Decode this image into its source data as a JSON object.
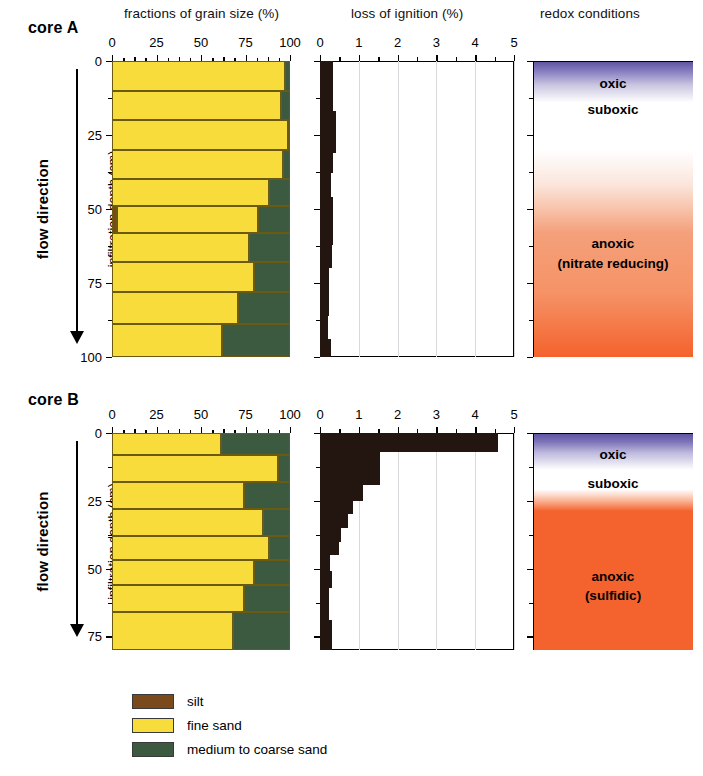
{
  "headers": {
    "grain_size": "fractions of grain size (%)",
    "loss_of_ignition": "loss of ignition (%)",
    "redox": "redox conditions"
  },
  "axis": {
    "y_label": "infiltration depth (cm)",
    "flow_direction": "flow direction",
    "grain_ticks": [
      "0",
      "25",
      "50",
      "75",
      "100"
    ],
    "loi_ticks": [
      "0",
      "1",
      "2",
      "3",
      "4",
      "5"
    ]
  },
  "legend": {
    "items": [
      {
        "label": "silt",
        "color": "#7a4a1c"
      },
      {
        "label": "fine sand",
        "color": "#f8dc3c"
      },
      {
        "label": "medium to coarse sand",
        "color": "#3b5a40"
      }
    ]
  },
  "colors": {
    "silt": "#7a4a1c",
    "fine_sand": "#f8dc3c",
    "coarse_sand": "#3b5a40",
    "loi_fill": "#231510",
    "oxic": "#5b4fa0",
    "suboxic": "#ffffff",
    "anoxic_a": "#f4a07a",
    "anoxic_b": "#f4622d"
  },
  "cores": [
    {
      "name": "core A",
      "depth_ticks": [
        "0",
        "25",
        "50",
        "75",
        "100"
      ],
      "depth_min": 0,
      "depth_max": 100,
      "redox": {
        "labels": [
          {
            "text": "oxic",
            "depth": 5
          },
          {
            "text": "suboxic",
            "depth": 14
          },
          {
            "text": "anoxic",
            "depth": 59
          },
          {
            "text": "(nitrate reducing)",
            "depth": 66
          }
        ]
      },
      "chart_data": [
        {
          "type": "bar",
          "title": "fractions of grain size (%)",
          "xlabel": "fractions of grain size (%)",
          "ylabel": "infiltration depth (cm)",
          "xlim": [
            0,
            100
          ],
          "ylim": [
            0,
            100
          ],
          "grid": false,
          "orientation": "horizontal-stacked",
          "series": [
            {
              "name": "silt",
              "values": [
                0,
                0,
                0,
                0,
                0,
                3,
                0,
                0,
                0,
                0
              ]
            },
            {
              "name": "fine sand",
              "values": [
                97,
                95,
                99,
                96,
                88,
                79,
                77,
                80,
                71,
                62
              ]
            },
            {
              "name": "medium to coarse sand",
              "values": [
                3,
                5,
                1,
                4,
                12,
                18,
                23,
                20,
                29,
                38
              ]
            }
          ],
          "bins": [
            {
              "top": 0,
              "bottom": 10
            },
            {
              "top": 10,
              "bottom": 20
            },
            {
              "top": 20,
              "bottom": 30
            },
            {
              "top": 30,
              "bottom": 40
            },
            {
              "top": 40,
              "bottom": 49
            },
            {
              "top": 49,
              "bottom": 58
            },
            {
              "top": 58,
              "bottom": 68
            },
            {
              "top": 68,
              "bottom": 78
            },
            {
              "top": 78,
              "bottom": 89
            },
            {
              "top": 89,
              "bottom": 100
            }
          ]
        },
        {
          "type": "bar",
          "title": "loss of ignition (%)",
          "xlabel": "loss of ignition (%)",
          "ylabel": "infiltration depth (cm)",
          "xlim": [
            0,
            5
          ],
          "ylim": [
            0,
            100
          ],
          "grid": true,
          "orientation": "horizontal",
          "values": [
            0.33,
            0.33,
            0.4,
            0.4,
            0.33,
            0.28,
            0.34,
            0.34,
            0.3,
            0.24,
            0.24,
            0.2,
            0.28
          ],
          "bins": [
            {
              "top": 0,
              "bottom": 9
            },
            {
              "top": 9,
              "bottom": 17
            },
            {
              "top": 17,
              "bottom": 24
            },
            {
              "top": 24,
              "bottom": 31
            },
            {
              "top": 31,
              "bottom": 38
            },
            {
              "top": 38,
              "bottom": 46
            },
            {
              "top": 46,
              "bottom": 54
            },
            {
              "top": 54,
              "bottom": 62
            },
            {
              "top": 62,
              "bottom": 70
            },
            {
              "top": 70,
              "bottom": 78
            },
            {
              "top": 78,
              "bottom": 86
            },
            {
              "top": 86,
              "bottom": 94
            },
            {
              "top": 94,
              "bottom": 100
            }
          ]
        }
      ]
    },
    {
      "name": "core B",
      "depth_ticks": [
        "0",
        "25",
        "50",
        "75"
      ],
      "depth_min": 0,
      "depth_max": 80,
      "redox": {
        "labels": [
          {
            "text": "oxic",
            "depth": 5
          },
          {
            "text": "suboxic",
            "depth": 16
          },
          {
            "text": "anoxic",
            "depth": 50
          },
          {
            "text": "(sulfidic)",
            "depth": 57
          }
        ]
      },
      "chart_data": [
        {
          "type": "bar",
          "title": "fractions of grain size (%)",
          "xlabel": "fractions of grain size (%)",
          "ylabel": "infiltration depth (cm)",
          "xlim": [
            0,
            100
          ],
          "ylim": [
            0,
            80
          ],
          "grid": false,
          "orientation": "horizontal-stacked",
          "series": [
            {
              "name": "silt",
              "values": [
                0,
                0,
                0,
                0,
                0,
                0,
                0,
                0
              ]
            },
            {
              "name": "fine sand",
              "values": [
                61,
                93,
                74,
                85,
                88,
                80,
                74,
                68
              ]
            },
            {
              "name": "medium to coarse sand",
              "values": [
                39,
                7,
                26,
                15,
                12,
                20,
                26,
                32
              ]
            }
          ],
          "bins": [
            {
              "top": 0,
              "bottom": 8
            },
            {
              "top": 8,
              "bottom": 18
            },
            {
              "top": 18,
              "bottom": 28
            },
            {
              "top": 28,
              "bottom": 38
            },
            {
              "top": 38,
              "bottom": 47
            },
            {
              "top": 47,
              "bottom": 56
            },
            {
              "top": 56,
              "bottom": 66
            },
            {
              "top": 66,
              "bottom": 80
            }
          ]
        },
        {
          "type": "bar",
          "title": "loss of ignition (%)",
          "xlabel": "loss of ignition (%)",
          "ylabel": "infiltration depth (cm)",
          "xlim": [
            0,
            5
          ],
          "ylim": [
            0,
            80
          ],
          "grid": true,
          "orientation": "horizontal",
          "values": [
            4.6,
            1.55,
            1.55,
            1.1,
            0.85,
            0.72,
            0.55,
            0.5,
            0.27,
            0.3,
            0.22,
            0.22,
            0.32,
            0.32
          ],
          "bins": [
            {
              "top": 0,
              "bottom": 7
            },
            {
              "top": 7,
              "bottom": 13
            },
            {
              "top": 13,
              "bottom": 19
            },
            {
              "top": 19,
              "bottom": 25
            },
            {
              "top": 25,
              "bottom": 30
            },
            {
              "top": 30,
              "bottom": 35
            },
            {
              "top": 35,
              "bottom": 40
            },
            {
              "top": 40,
              "bottom": 45
            },
            {
              "top": 45,
              "bottom": 51
            },
            {
              "top": 51,
              "bottom": 57
            },
            {
              "top": 57,
              "bottom": 63
            },
            {
              "top": 63,
              "bottom": 69
            },
            {
              "top": 69,
              "bottom": 75
            },
            {
              "top": 75,
              "bottom": 80
            }
          ]
        }
      ]
    }
  ]
}
